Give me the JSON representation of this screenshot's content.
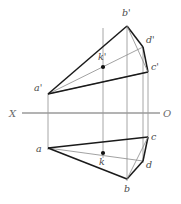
{
  "figure": {
    "background": "#ffffff",
    "stroke_heavy": "#1a1a1a",
    "stroke_light": "#8a8a8a",
    "stroke_axis": "#909090",
    "label_color": "#4a4a4a",
    "axis_label_color": "#6b6b6b"
  },
  "axis": {
    "name": "ground-line",
    "x_label": "X",
    "o_label": "O",
    "y": 113,
    "x_start": 22,
    "x_end": 160,
    "x_label_pos": {
      "x": 11,
      "y": 117
    },
    "o_label_pos": {
      "x": 163,
      "y": 117
    }
  },
  "points": {
    "a_prime": {
      "label": "a'",
      "x": 48,
      "y": 94,
      "label_x": 34,
      "label_y": 91
    },
    "b_prime": {
      "label": "b'",
      "x": 127,
      "y": 26,
      "label_x": 122,
      "label_y": 16
    },
    "c_prime": {
      "label": "c'",
      "x": 148,
      "y": 72,
      "label_x": 151,
      "label_y": 70
    },
    "d_prime": {
      "label": "d'",
      "x": 143,
      "y": 47,
      "label_x": 146,
      "label_y": 43
    },
    "k_prime": {
      "label": "k'",
      "x": 103,
      "y": 67,
      "label_x": 98,
      "label_y": 60
    },
    "a": {
      "label": "a",
      "x": 48,
      "y": 148,
      "label_x": 36,
      "label_y": 152
    },
    "b": {
      "label": "b",
      "x": 127,
      "y": 179,
      "label_x": 124,
      "label_y": 192
    },
    "c": {
      "label": "c",
      "x": 148,
      "y": 137,
      "label_x": 151,
      "label_y": 140
    },
    "d": {
      "label": "d",
      "x": 143,
      "y": 161,
      "label_x": 146,
      "label_y": 168
    },
    "k": {
      "label": "k",
      "x": 103,
      "y": 153,
      "label_x": 99,
      "label_y": 165
    }
  },
  "edges_top_view": [
    {
      "name": "a-prime-to-b-prime",
      "weight": "heavy"
    },
    {
      "name": "b-prime-to-c-prime",
      "weight": "heavy"
    },
    {
      "name": "c-prime-to-a-prime",
      "weight": "heavy"
    },
    {
      "name": "a-prime-to-d-prime",
      "weight": "light"
    },
    {
      "name": "b-prime-to-d-prime",
      "weight": "heavy"
    },
    {
      "name": "d-prime-to-c-prime",
      "weight": "heavy"
    }
  ],
  "edges_bottom_view": [
    {
      "name": "a-to-b",
      "weight": "heavy"
    },
    {
      "name": "b-to-c",
      "weight": "heavy"
    },
    {
      "name": "c-to-a",
      "weight": "heavy"
    },
    {
      "name": "a-to-d",
      "weight": "light"
    },
    {
      "name": "b-to-d",
      "weight": "heavy"
    },
    {
      "name": "d-to-c",
      "weight": "heavy"
    }
  ],
  "projection_lines": [
    {
      "name": "projector-a",
      "x": 48
    },
    {
      "name": "projector-k",
      "x": 103
    },
    {
      "name": "projector-b",
      "x": 127
    },
    {
      "name": "projector-d",
      "x": 143
    },
    {
      "name": "projector-c",
      "x": 148
    }
  ]
}
